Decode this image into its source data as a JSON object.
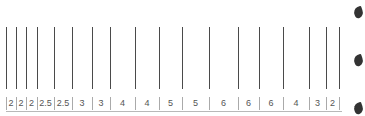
{
  "diagram": {
    "lines_x": [
      6,
      16,
      26,
      37,
      54,
      72,
      92,
      110,
      135,
      159,
      182,
      209,
      238,
      259,
      283,
      309,
      326,
      339
    ],
    "spacing_labels": [
      "2",
      "2",
      "2",
      "2.5",
      "2.5",
      "3",
      "3",
      "4",
      "4",
      "5",
      "5",
      "6",
      "6",
      "6",
      "4",
      "3",
      "2"
    ],
    "line_color": "#4a4a4a",
    "label_color": "#555555",
    "right_marks_y": [
      12,
      60,
      108
    ]
  }
}
